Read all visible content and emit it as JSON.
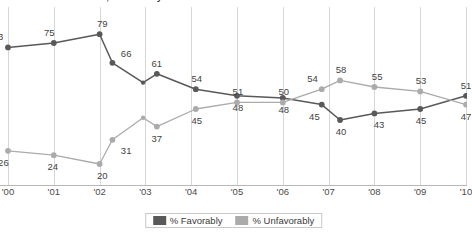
{
  "title": "Generational divide, favorability of ...",
  "legend": {
    "favorably_label": "% Favorably",
    "unfavorably_label": "% Unfavorably",
    "favorably_color": "#595959",
    "unfavorably_color": "#ababab"
  },
  "chart_data": {
    "type": "line",
    "title": "Generational divide, favorability of ...",
    "xlabel": "",
    "ylabel": "",
    "ylim": [
      15,
      85
    ],
    "grid": "vertical",
    "legend_position": "bottom-center",
    "categories": [
      "'00",
      "'01",
      "'02",
      "'03",
      "'04",
      "'05",
      "'06",
      "'07",
      "'08",
      "'09",
      "'10"
    ],
    "tick_labels": [
      "'00",
      "'01",
      "'02",
      "'03",
      "'04",
      "'05",
      "'06",
      "'07",
      "'08",
      "'09",
      "'10"
    ],
    "series": [
      {
        "name": "% Favorably",
        "color": "#595959",
        "points": [
          {
            "x": 0.0,
            "y": 73,
            "label": "73",
            "lx": -0.22,
            "ly": 11
          },
          {
            "x": 1.0,
            "y": 75,
            "label": "75",
            "lx": -0.1,
            "ly": 11
          },
          {
            "x": 2.0,
            "y": 79,
            "label": "79",
            "lx": 0.06,
            "ly": 11
          },
          {
            "x": 2.28,
            "y": 66,
            "label": "66",
            "lx": 0.3,
            "ly": 10
          },
          {
            "x": 2.95,
            "y": 57,
            "label": "",
            "lx": 0.0,
            "ly": 0
          },
          {
            "x": 3.25,
            "y": 61,
            "label": "61",
            "lx": 0.0,
            "ly": 11
          },
          {
            "x": 4.1,
            "y": 54,
            "label": "54",
            "lx": 0.02,
            "ly": 11
          },
          {
            "x": 5.0,
            "y": 51,
            "label": "48",
            "lx": 0.02,
            "ly": -11
          },
          {
            "x": 6.0,
            "y": 50,
            "label": "48",
            "lx": 0.02,
            "ly": -11
          },
          {
            "x": 6.85,
            "y": 47,
            "label": "45",
            "lx": -0.16,
            "ly": -11
          },
          {
            "x": 7.25,
            "y": 40,
            "label": "40",
            "lx": 0.02,
            "ly": -11
          },
          {
            "x": 8.0,
            "y": 43,
            "label": "43",
            "lx": 0.1,
            "ly": -11
          },
          {
            "x": 9.0,
            "y": 45,
            "label": "45",
            "lx": 0.02,
            "ly": -11
          },
          {
            "x": 10.0,
            "y": 51,
            "label": "51",
            "lx": 0.0,
            "ly": 11
          }
        ]
      },
      {
        "name": "% Unfavorably",
        "color": "#ababab",
        "points": [
          {
            "x": 0.0,
            "y": 26,
            "label": "26",
            "lx": -0.1,
            "ly": -11
          },
          {
            "x": 1.0,
            "y": 24,
            "label": "24",
            "lx": -0.02,
            "ly": -11
          },
          {
            "x": 2.0,
            "y": 20,
            "label": "20",
            "lx": 0.06,
            "ly": -11
          },
          {
            "x": 2.28,
            "y": 31,
            "label": "31",
            "lx": 0.3,
            "ly": -10
          },
          {
            "x": 2.95,
            "y": 41,
            "label": "",
            "lx": 0.0,
            "ly": 0
          },
          {
            "x": 3.25,
            "y": 37,
            "label": "37",
            "lx": 0.0,
            "ly": -11
          },
          {
            "x": 4.1,
            "y": 45,
            "label": "45",
            "lx": 0.02,
            "ly": -11
          },
          {
            "x": 5.0,
            "y": 48,
            "label": "51",
            "lx": 0.02,
            "ly": 11
          },
          {
            "x": 6.0,
            "y": 48,
            "label": "50",
            "lx": 0.02,
            "ly": 11
          },
          {
            "x": 6.85,
            "y": 54,
            "label": "54",
            "lx": -0.2,
            "ly": 11
          },
          {
            "x": 7.25,
            "y": 58,
            "label": "58",
            "lx": 0.02,
            "ly": 11
          },
          {
            "x": 8.0,
            "y": 55,
            "label": "55",
            "lx": 0.06,
            "ly": 11
          },
          {
            "x": 9.0,
            "y": 53,
            "label": "53",
            "lx": 0.02,
            "ly": 11
          },
          {
            "x": 10.0,
            "y": 47,
            "label": "47",
            "lx": 0.0,
            "ly": -11
          }
        ]
      }
    ]
  }
}
